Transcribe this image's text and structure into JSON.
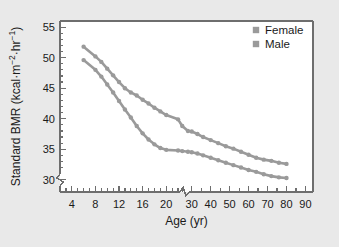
{
  "figure": {
    "background_color": "#e9e9e9",
    "plot_background_color": "#ffffff",
    "frame_color": "#6e6e6e",
    "text_color": "#1a1a1a"
  },
  "chart_data": {
    "type": "line",
    "title": "",
    "xlabel": "Age (yr)",
    "ylabel": "Standard BMR (kcal·m⁻²·hr⁻¹)",
    "ylabel_parts": {
      "main": "Standard BMR (kcal",
      "dot1": "·",
      "m": "m",
      "sup_m": "−2",
      "dot2": "·",
      "hr": "hr",
      "sup_hr": "−1",
      "close": ")"
    },
    "xlim": [
      2,
      94
    ],
    "ylim": [
      28,
      56
    ],
    "grid": false,
    "axis_break_x": true,
    "axis_break_x_at": 25,
    "axis_break_y": true,
    "yticks": [
      30,
      35,
      40,
      45,
      50,
      55
    ],
    "ytick_labels": [
      "30",
      "35",
      "40",
      "45",
      "50",
      "55"
    ],
    "yminor_step": 1,
    "xticks_labeled": [
      4,
      8,
      12,
      16,
      20,
      30,
      40,
      50,
      60,
      70,
      80,
      90
    ],
    "xtick_labels": [
      "4",
      "8",
      "12",
      "16",
      "20",
      "30",
      "40",
      "50",
      "60",
      "70",
      "80",
      "90"
    ],
    "xticks_minor_lower": [
      3,
      5,
      6,
      7,
      9,
      10,
      11,
      13,
      14,
      15,
      17,
      18,
      19,
      21,
      22
    ],
    "xticks_minor_upper": [
      25,
      35,
      45,
      55,
      65,
      75,
      85
    ],
    "legend": {
      "position": "top-right",
      "entries": [
        {
          "label": "Female",
          "color": "#9a9a9a",
          "marker": "square"
        },
        {
          "label": "Male",
          "color": "#9a9a9a",
          "marker": "square"
        }
      ]
    },
    "series": [
      {
        "name": "Male",
        "color": "#9a9a9a",
        "marker": "circle",
        "points": [
          {
            "x": 6,
            "y": 51.8
          },
          {
            "x": 8,
            "y": 50.2
          },
          {
            "x": 9,
            "y": 49.3
          },
          {
            "x": 10,
            "y": 48.2
          },
          {
            "x": 11,
            "y": 47.1
          },
          {
            "x": 12,
            "y": 46.0
          },
          {
            "x": 13,
            "y": 45.0
          },
          {
            "x": 14,
            "y": 44.3
          },
          {
            "x": 15,
            "y": 43.8
          },
          {
            "x": 16,
            "y": 43.1
          },
          {
            "x": 17,
            "y": 42.5
          },
          {
            "x": 18,
            "y": 41.8
          },
          {
            "x": 19,
            "y": 41.2
          },
          {
            "x": 20,
            "y": 40.6
          },
          {
            "x": 22,
            "y": 39.9
          },
          {
            "x": 25,
            "y": 38.8
          },
          {
            "x": 28,
            "y": 38.0
          },
          {
            "x": 30,
            "y": 37.9
          },
          {
            "x": 33,
            "y": 37.5
          },
          {
            "x": 36,
            "y": 37.0
          },
          {
            "x": 40,
            "y": 36.5
          },
          {
            "x": 44,
            "y": 36.0
          },
          {
            "x": 48,
            "y": 35.5
          },
          {
            "x": 52,
            "y": 35.1
          },
          {
            "x": 56,
            "y": 34.6
          },
          {
            "x": 60,
            "y": 34.1
          },
          {
            "x": 64,
            "y": 33.6
          },
          {
            "x": 68,
            "y": 33.3
          },
          {
            "x": 72,
            "y": 33.1
          },
          {
            "x": 76,
            "y": 32.8
          },
          {
            "x": 80,
            "y": 32.6
          }
        ]
      },
      {
        "name": "Female",
        "color": "#9a9a9a",
        "marker": "circle",
        "points": [
          {
            "x": 6,
            "y": 49.6
          },
          {
            "x": 8,
            "y": 48.0
          },
          {
            "x": 9,
            "y": 46.9
          },
          {
            "x": 10,
            "y": 45.6
          },
          {
            "x": 11,
            "y": 44.3
          },
          {
            "x": 12,
            "y": 42.9
          },
          {
            "x": 13,
            "y": 41.5
          },
          {
            "x": 14,
            "y": 40.2
          },
          {
            "x": 15,
            "y": 38.8
          },
          {
            "x": 16,
            "y": 37.6
          },
          {
            "x": 17,
            "y": 36.6
          },
          {
            "x": 18,
            "y": 35.8
          },
          {
            "x": 19,
            "y": 35.2
          },
          {
            "x": 20,
            "y": 34.9
          },
          {
            "x": 22,
            "y": 34.8
          },
          {
            "x": 25,
            "y": 34.7
          },
          {
            "x": 28,
            "y": 34.6
          },
          {
            "x": 30,
            "y": 34.5
          },
          {
            "x": 33,
            "y": 34.3
          },
          {
            "x": 36,
            "y": 34.0
          },
          {
            "x": 40,
            "y": 33.6
          },
          {
            "x": 44,
            "y": 33.2
          },
          {
            "x": 48,
            "y": 32.8
          },
          {
            "x": 52,
            "y": 32.4
          },
          {
            "x": 56,
            "y": 32.0
          },
          {
            "x": 60,
            "y": 31.6
          },
          {
            "x": 64,
            "y": 31.3
          },
          {
            "x": 68,
            "y": 30.9
          },
          {
            "x": 72,
            "y": 30.6
          },
          {
            "x": 76,
            "y": 30.4
          },
          {
            "x": 80,
            "y": 30.3
          }
        ]
      }
    ]
  }
}
